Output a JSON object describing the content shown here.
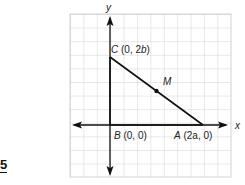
{
  "problem_number": "5",
  "axes": {
    "x_label": "x",
    "y_label": "y"
  },
  "points": {
    "C": {
      "name": "C",
      "coords": "(0, 2b)",
      "open": "(0, 2",
      "var": "b",
      "close": ")"
    },
    "B": {
      "name": "B",
      "coords": "(0, 0)",
      "open": "(0, 0)"
    },
    "A": {
      "name": "A",
      "coords": "(2a, 0)",
      "open": "(2a, 0)"
    },
    "M": {
      "name": "M"
    }
  },
  "colors": {
    "grid": "#c8c8c8",
    "lines": "#111111",
    "background": "#ffffff"
  }
}
